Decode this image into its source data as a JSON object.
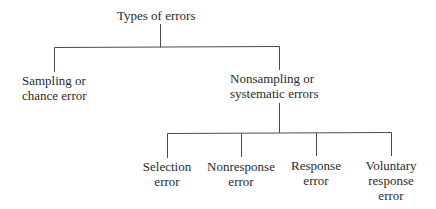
{
  "diagram": {
    "type": "tree",
    "root": {
      "label": "Types of errors"
    },
    "level1": [
      {
        "lines": [
          "Sampling or",
          "chance error"
        ]
      },
      {
        "lines": [
          "Nonsampling or",
          "systematic errors"
        ]
      }
    ],
    "level2": [
      {
        "lines": [
          "Selection",
          "error"
        ]
      },
      {
        "lines": [
          "Nonresponse",
          "error"
        ]
      },
      {
        "lines": [
          "Response",
          "error"
        ]
      },
      {
        "lines": [
          "Voluntary",
          "response",
          "error"
        ]
      }
    ],
    "colors": {
      "line": "#4a4a4a",
      "text": "#2a2a2a",
      "background": "#ffffff"
    }
  }
}
